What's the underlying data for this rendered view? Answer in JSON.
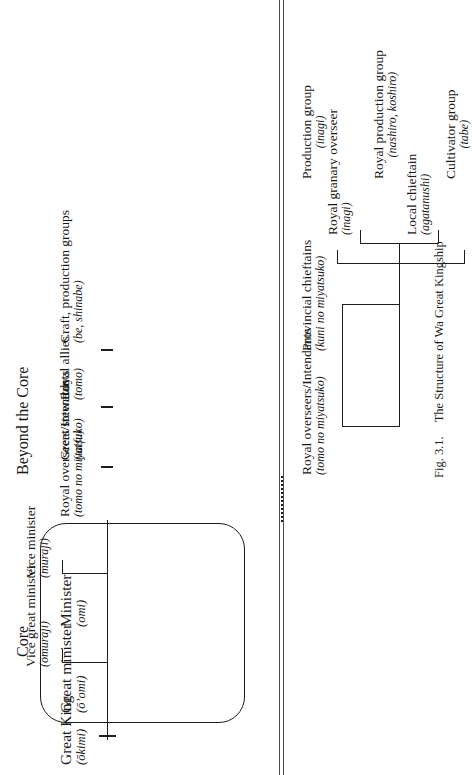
{
  "figure": {
    "caption_number": "Fig. 3.1.",
    "caption_title": "The Structure of Wa Great Kingship",
    "sections": {
      "core": "Core",
      "beyond": "Beyond the Core"
    }
  },
  "core": {
    "great_king": {
      "title": "Great King",
      "romaji": "(ōkimi)"
    },
    "great_minister": {
      "title": "Great minister",
      "romaji": "(ō’omi)"
    },
    "vice_great_minister": {
      "title": "Vice great minister",
      "romaji": "(ōmuraji)"
    },
    "minister": {
      "title": "Minister",
      "romaji": "(omi)"
    },
    "vice_minister": {
      "title": "Vice minister",
      "romaji": "(muraji)"
    },
    "royal_overseers": {
      "title": "Royal overseers/Intendants",
      "romaji": "(tomo no miyatsuko)"
    },
    "great_stewards": {
      "title": "Great stewards",
      "romaji": "(taifu)"
    },
    "royal_allies": {
      "title": "Royal allies",
      "romaji": "(tomo)"
    },
    "craft_groups": {
      "title": "Craft, production groups",
      "romaji": "(be, shinabe)"
    }
  },
  "beyond": {
    "royal_overseers": {
      "title": "Royal overseers/Intendants",
      "romaji": "(tomo no miyatsuko)"
    },
    "provincial_chieftains": {
      "title": "Provincial chieftains",
      "romaji": "(kuni no miyatsuko)"
    },
    "local_chieftain": {
      "title": "Local chieftain",
      "romaji": "(agatanushi)"
    },
    "royal_granary_overseer": {
      "title": "Royal granary overseer",
      "romaji": "(inagi)"
    },
    "production_group": {
      "title": "Production group",
      "romaji": "(inagi)"
    },
    "royal_production_group": {
      "title": "Royal production group",
      "romaji": "(nashiro, koshiro)"
    },
    "cultivator_group": {
      "title": "Cultivator group",
      "romaji": "(tabe)"
    }
  },
  "colors": {
    "ink": "#1d1d1d",
    "rule": "#4a4a4a",
    "paper": "#ffffff"
  }
}
